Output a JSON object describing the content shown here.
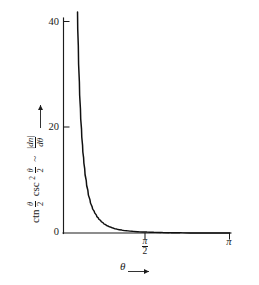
{
  "chart_data": {
    "type": "line",
    "title": "",
    "subtitle": "",
    "xlabel": "θ",
    "xlabel_arrow": "⟶",
    "ylabel_parts": {
      "ctn": "ctn",
      "ctn_arg_num": "θ",
      "ctn_arg_den": "2",
      "csc": "csc",
      "csc_exponent": "2",
      "csc_arg_num": "θ",
      "csc_arg_den": "2",
      "relation": "~",
      "rhs_num": "|dn|",
      "rhs_den": "dθ"
    },
    "ylabel_text": "ctn θ/2 csc² θ/2 ~ |dn|/dθ",
    "xtick_labels": [
      "π/2",
      "π"
    ],
    "xtick_values": [
      1.5707963,
      3.1415927
    ],
    "xtick_pi_half_num": "π",
    "xtick_pi_half_den": "2",
    "xtick_pi": "π",
    "ytick_labels": [
      "0",
      "20",
      "40"
    ],
    "ytick_values": [
      0,
      20,
      40
    ],
    "xlim": [
      0,
      3.1415927
    ],
    "ylim": [
      0,
      44
    ],
    "grid": false,
    "legend": false,
    "legend_position": "none",
    "series": [
      {
        "name": "ctn(θ/2) csc²(θ/2)",
        "x": [
          0.265,
          0.28,
          0.3,
          0.32,
          0.34,
          0.36,
          0.38,
          0.4,
          0.43,
          0.46,
          0.5,
          0.54,
          0.58,
          0.62,
          0.66,
          0.7,
          0.75,
          0.8,
          0.85,
          0.9,
          0.95,
          1.0,
          1.1,
          1.2,
          1.3,
          1.4,
          1.5707963,
          1.7,
          1.85,
          2.0,
          2.2,
          2.4,
          2.6,
          2.8,
          3.0,
          3.1415927
        ],
        "y": [
          41.8,
          35.4,
          28.6,
          23.5,
          19.7,
          16.6,
          14.2,
          12.2,
          9.9,
          8.1,
          6.3,
          5.0,
          4.1,
          3.4,
          2.8,
          2.4,
          1.9,
          1.55,
          1.28,
          1.07,
          0.9,
          0.76,
          0.56,
          0.42,
          0.31,
          0.24,
          0.1716,
          0.125,
          0.084,
          0.056,
          0.03,
          0.015,
          0.0062,
          0.0019,
          0.0002,
          0.0
        ]
      }
    ],
    "annotations": [],
    "axis_style": {
      "spines": [
        "left",
        "bottom"
      ],
      "tick_direction": "out",
      "color": "#111111"
    }
  },
  "figure": {
    "background": "#ffffff",
    "ink": "#111111",
    "caption": ""
  }
}
